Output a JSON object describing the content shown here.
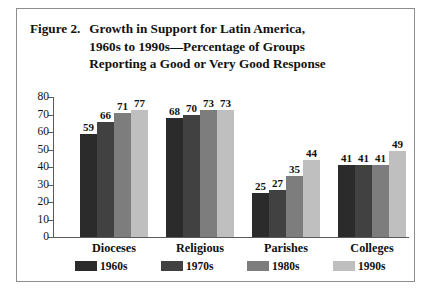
{
  "figure": {
    "number_label": "Figure 2.",
    "title_lines": [
      "Growth in Support for Latin America,",
      "1960s to 1990s—Percentage of Groups",
      "Reporting a Good or Very Good Response"
    ]
  },
  "chart_data": {
    "type": "bar",
    "title": "Figure 2.  Growth in Support for Latin America, 1960s to 1990s—Percentage of Groups Reporting a Good or Very Good Response",
    "xlabel": "",
    "ylabel": "",
    "ylim": [
      0,
      80
    ],
    "yticks": [
      0,
      10,
      20,
      30,
      40,
      50,
      60,
      70,
      80
    ],
    "ytick_labels": [
      "0",
      "10",
      "20",
      "30",
      "40",
      "50",
      "60",
      "70",
      "80"
    ],
    "grid": false,
    "legend_position": "bottom",
    "categories": [
      "Dioceses",
      "Religious",
      "Parishes",
      "Colleges"
    ],
    "series": [
      {
        "name": "1960s",
        "color": "#2b2b2b",
        "values": [
          59,
          68,
          25,
          41
        ]
      },
      {
        "name": "1970s",
        "color": "#414141",
        "values": [
          66,
          70,
          27,
          41
        ]
      },
      {
        "name": "1980s",
        "color": "#7d7d7d",
        "values": [
          71,
          73,
          35,
          41
        ]
      },
      {
        "name": "1990s",
        "color": "#bfbfbf",
        "values": [
          77,
          73,
          44,
          49
        ]
      }
    ]
  }
}
